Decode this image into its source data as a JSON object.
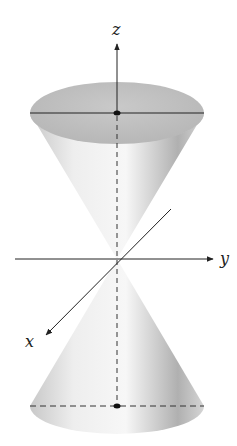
{
  "figure": {
    "axes": {
      "x": {
        "label": "x"
      },
      "y": {
        "label": "y"
      },
      "z": {
        "label": "z"
      }
    },
    "colors": {
      "axis": "#222222",
      "surface_light": "#f4f4f4",
      "surface_dark": "#9a9a9a",
      "ellipse_top": "#bdbdbd"
    }
  }
}
